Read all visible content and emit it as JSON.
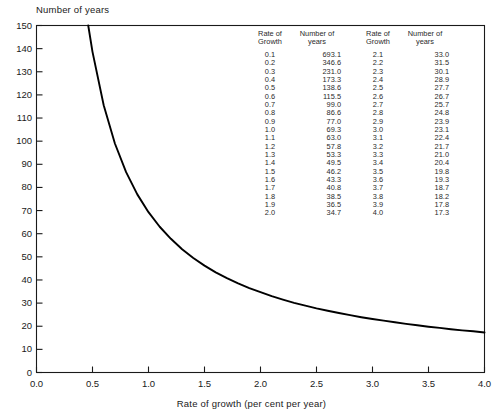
{
  "chart_data": {
    "type": "line",
    "title": "",
    "xlabel": "Rate of growth (per cent per year)",
    "ylabel": "Number of years",
    "xlim": [
      0.0,
      4.0
    ],
    "ylim": [
      0,
      150
    ],
    "grid": false,
    "legend": null,
    "formula_note": "doubling time = 69.3 / rate",
    "xticks": [
      "0.0",
      "0.5",
      "1.0",
      "1.5",
      "2.0",
      "2.5",
      "3.0",
      "3.5",
      "4.0"
    ],
    "xtick_values": [
      0.0,
      0.5,
      1.0,
      1.5,
      2.0,
      2.5,
      3.0,
      3.5,
      4.0
    ],
    "yticks": [
      "0",
      "10",
      "20",
      "30",
      "40",
      "50",
      "60",
      "70",
      "80",
      "90",
      "100",
      "110",
      "120",
      "130",
      "140",
      "150"
    ],
    "ytick_values": [
      0,
      10,
      20,
      30,
      40,
      50,
      60,
      70,
      80,
      90,
      100,
      110,
      120,
      130,
      140,
      150
    ],
    "series": [
      {
        "name": "Doubling time",
        "x": [
          0.462,
          0.5,
          0.6,
          0.7,
          0.8,
          0.9,
          1.0,
          1.1,
          1.2,
          1.3,
          1.4,
          1.5,
          1.6,
          1.7,
          1.8,
          1.9,
          2.0,
          2.1,
          2.2,
          2.3,
          2.4,
          2.5,
          2.6,
          2.7,
          2.8,
          2.9,
          3.0,
          3.1,
          3.2,
          3.3,
          3.4,
          3.5,
          3.6,
          3.7,
          3.8,
          3.9,
          4.0
        ],
        "values": [
          150.0,
          138.6,
          115.5,
          99.0,
          86.6,
          77.0,
          69.3,
          63.0,
          57.8,
          53.3,
          49.5,
          46.2,
          43.3,
          40.8,
          38.5,
          36.5,
          34.7,
          33.0,
          31.5,
          30.1,
          28.9,
          27.7,
          26.7,
          25.7,
          24.8,
          23.9,
          23.1,
          22.4,
          21.7,
          21.0,
          20.4,
          19.8,
          19.3,
          18.7,
          18.2,
          17.8,
          17.3
        ]
      }
    ]
  },
  "axis": {
    "y_title": "Number of years",
    "x_title": "Rate of growth (per cent per year)"
  },
  "table": {
    "headers": {
      "rate_line1": "Rate of",
      "rate_line2": "Growth",
      "years_line1": "Number of",
      "years_line2": "years"
    },
    "rows": [
      {
        "rate_a": "0.1",
        "years_a": "693.1",
        "rate_b": "2.1",
        "years_b": "33.0"
      },
      {
        "rate_a": "0.2",
        "years_a": "346.6",
        "rate_b": "2.2",
        "years_b": "31.5"
      },
      {
        "rate_a": "0.3",
        "years_a": "231.0",
        "rate_b": "2.3",
        "years_b": "30.1"
      },
      {
        "rate_a": "0.4",
        "years_a": "173.3",
        "rate_b": "2.4",
        "years_b": "28.9"
      },
      {
        "rate_a": "0.5",
        "years_a": "138.6",
        "rate_b": "2.5",
        "years_b": "27.7"
      },
      {
        "rate_a": "0.6",
        "years_a": "115.5",
        "rate_b": "2.6",
        "years_b": "26.7"
      },
      {
        "rate_a": "0.7",
        "years_a": "99.0",
        "rate_b": "2.7",
        "years_b": "25.7"
      },
      {
        "rate_a": "0.8",
        "years_a": "86.6",
        "rate_b": "2.8",
        "years_b": "24.8"
      },
      {
        "rate_a": "0.9",
        "years_a": "77.0",
        "rate_b": "2.9",
        "years_b": "23.9"
      },
      {
        "rate_a": "1.0",
        "years_a": "69.3",
        "rate_b": "3.0",
        "years_b": "23.1"
      },
      {
        "rate_a": "1.1",
        "years_a": "63.0",
        "rate_b": "3.1",
        "years_b": "22.4"
      },
      {
        "rate_a": "1.2",
        "years_a": "57.8",
        "rate_b": "3.2",
        "years_b": "21.7"
      },
      {
        "rate_a": "1.3",
        "years_a": "53.3",
        "rate_b": "3.3",
        "years_b": "21.0"
      },
      {
        "rate_a": "1.4",
        "years_a": "49.5",
        "rate_b": "3.4",
        "years_b": "20.4"
      },
      {
        "rate_a": "1.5",
        "years_a": "46.2",
        "rate_b": "3.5",
        "years_b": "19.8"
      },
      {
        "rate_a": "1.6",
        "years_a": "43.3",
        "rate_b": "3.6",
        "years_b": "19.3"
      },
      {
        "rate_a": "1.7",
        "years_a": "40.8",
        "rate_b": "3.7",
        "years_b": "18.7"
      },
      {
        "rate_a": "1.8",
        "years_a": "38.5",
        "rate_b": "3.8",
        "years_b": "18.2"
      },
      {
        "rate_a": "1.9",
        "years_a": "36.5",
        "rate_b": "3.9",
        "years_b": "17.8"
      },
      {
        "rate_a": "2.0",
        "years_a": "34.7",
        "rate_b": "4.0",
        "years_b": "17.3"
      }
    ]
  },
  "colors": {
    "curve": "#000000",
    "axis": "#1a1a1a",
    "text": "#1a1a1a",
    "background": "#ffffff"
  }
}
